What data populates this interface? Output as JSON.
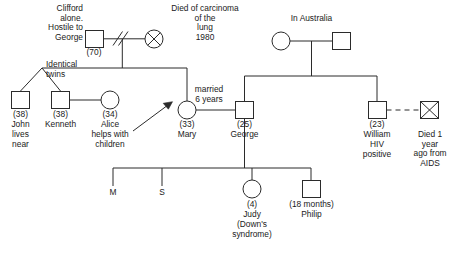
{
  "diagram": {
    "type": "genogram",
    "stroke_color": "#2b2b2b",
    "text_color": "#1a1a1a",
    "background": "#ffffff"
  },
  "people": {
    "clifford": {
      "symbol": "square",
      "age": "(70)",
      "note": "Clifford\nalone.\nHostile to\nGeorge"
    },
    "grandmother_deceased": {
      "symbol": "circle-crossed",
      "note": "Died of carcinoma\nof the\nlung\n1980"
    },
    "john": {
      "symbol": "square",
      "age": "(38)",
      "name": "John",
      "note": "lives\nnear"
    },
    "kenneth": {
      "symbol": "square",
      "age": "(38)",
      "name": "Kenneth"
    },
    "alice": {
      "symbol": "circle",
      "age": "(34)",
      "name": "Alice",
      "note": "helps with\nchildren"
    },
    "mary": {
      "symbol": "circle",
      "age": "(33)",
      "name": "Mary",
      "is_index": true
    },
    "george": {
      "symbol": "square",
      "age": "(25)",
      "name": "George"
    },
    "australia_mother": {
      "symbol": "circle"
    },
    "australia_father": {
      "symbol": "square"
    },
    "william": {
      "symbol": "square",
      "age": "(23)",
      "name": "William",
      "note": "HIV\npositive"
    },
    "partner_deceased": {
      "symbol": "square-crossed",
      "note": "Died 1 year\nago from\nAIDS"
    },
    "child_m": {
      "symbol": "none",
      "name": "M"
    },
    "child_s": {
      "symbol": "none",
      "name": "S"
    },
    "judy": {
      "symbol": "circle",
      "age": "(4)",
      "name": "Judy",
      "note": "(Down's\nsyndrome)"
    },
    "philip": {
      "symbol": "square",
      "age": "(18 months)",
      "name": "Philip"
    }
  },
  "annotations": {
    "identical_twins": "Identical\ntwins",
    "in_australia": "In Australia",
    "married_6_years": "married\n6 years"
  },
  "relationship_markers": {
    "divorce": "double-slash",
    "partnership_unmarried": "dashed-line",
    "index_person": "arrow"
  }
}
